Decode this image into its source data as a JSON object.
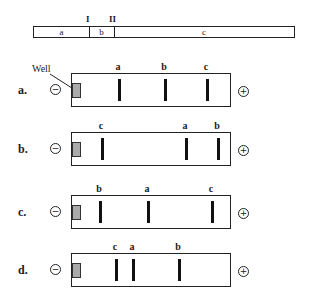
{
  "restriction_map": {
    "sites": [
      "I",
      "II"
    ],
    "segments": [
      {
        "label": "a",
        "start": 0,
        "end": 55
      },
      {
        "label": "b",
        "start": 55,
        "end": 80
      },
      {
        "label": "c",
        "start": 80,
        "end": 262
      }
    ]
  },
  "well_label": "Well",
  "poles": {
    "negative": "−",
    "positive": "+"
  },
  "gels": [
    {
      "label": "a.",
      "top": 73,
      "bands": [
        {
          "name": "a",
          "x": 46
        },
        {
          "name": "b",
          "x": 92
        },
        {
          "name": "c",
          "x": 134
        }
      ]
    },
    {
      "label": "b.",
      "top": 132,
      "bands": [
        {
          "name": "c",
          "x": 29
        },
        {
          "name": "a",
          "x": 113
        },
        {
          "name": "b",
          "x": 145
        }
      ]
    },
    {
      "label": "c.",
      "top": 195,
      "bands": [
        {
          "name": "b",
          "x": 27
        },
        {
          "name": "a",
          "x": 75
        },
        {
          "name": "c",
          "x": 139
        }
      ]
    },
    {
      "label": "d.",
      "top": 253,
      "bands": [
        {
          "name": "c",
          "x": 43
        },
        {
          "name": "a",
          "x": 60
        },
        {
          "name": "b",
          "x": 106
        }
      ]
    }
  ]
}
